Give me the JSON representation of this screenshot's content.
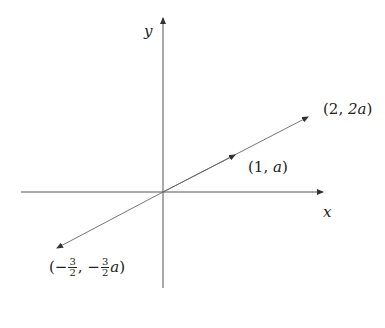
{
  "diagram": {
    "type": "coordinate-plane-vector",
    "axes": {
      "x_label": "x",
      "y_label": "y",
      "color": "#555555"
    },
    "origin_px": [
      163,
      192
    ],
    "line": {
      "color": "#555555",
      "points": [
        {
          "label": "(2, 2a)",
          "open": "(",
          "a": "2",
          "sep": ", ",
          "b": "2a",
          "close": ")"
        },
        {
          "label": "(1, a)",
          "open": "(",
          "a": "1",
          "sep": ", ",
          "b": "a",
          "close": ")"
        },
        {
          "label": "(−3/2, −3/2 a)",
          "open": "(",
          "minus": "−",
          "num": "3",
          "den": "2",
          "sep": ", ",
          "var": "a",
          "close": ")"
        }
      ]
    }
  }
}
